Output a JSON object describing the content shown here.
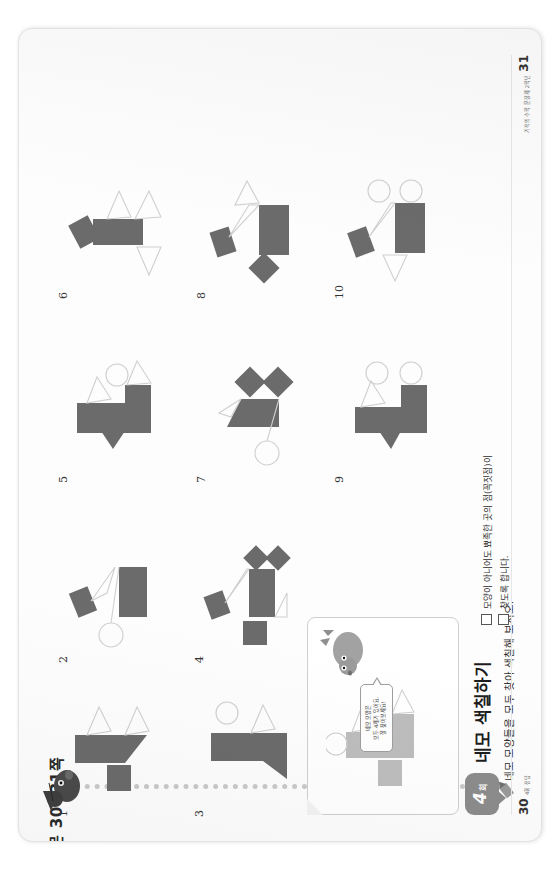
{
  "document": {
    "header_reference": "본문 30~31쪽",
    "sheet_type": "workbook-answer-spread"
  },
  "activity": {
    "badge_number": "4",
    "badge_unit": "회",
    "title": "네모 색칠하기",
    "instruction": "네모 모양들을 모두 찾아 색칠해 보시오.",
    "pencil_icon": "pencil-icon"
  },
  "character": {
    "name": "mouse-character",
    "speech_bubble_lines": [
      "네모 모양은",
      "모두 4개가 있어요.",
      "잘 찾아보세요!"
    ]
  },
  "example_panel": {
    "label": "example-figure-panel"
  },
  "teacher_note": {
    "lines": [
      "모양이 아니어도 뾰족한 곳의 점(꼭짓점)이",
      "찾도록 합니다."
    ],
    "checkbox_count": 2
  },
  "pages": {
    "left": {
      "number": "30",
      "note": "4회 정답"
    },
    "right": {
      "number": "31",
      "note": "기적의 수학 문장제 2학년"
    }
  },
  "colors": {
    "shape_fill": "#6b6b6b",
    "shape_outline": "#cfcfcf",
    "example_fill": "#bdbdbd",
    "sheet_bg": "#fdfdfd",
    "badge": "#8c8c8c",
    "dotted_rule": "#c9c9c9"
  },
  "figures": [
    {
      "label": "1",
      "name": "figure-1"
    },
    {
      "label": "2",
      "name": "figure-2"
    },
    {
      "label": "3",
      "name": "figure-3"
    },
    {
      "label": "4",
      "name": "figure-4"
    },
    {
      "label": "5",
      "name": "figure-5"
    },
    {
      "label": "6",
      "name": "figure-6"
    },
    {
      "label": "7",
      "name": "figure-7"
    },
    {
      "label": "8",
      "name": "figure-8"
    },
    {
      "label": "9",
      "name": "figure-9"
    },
    {
      "label": "10",
      "name": "figure-10"
    }
  ]
}
